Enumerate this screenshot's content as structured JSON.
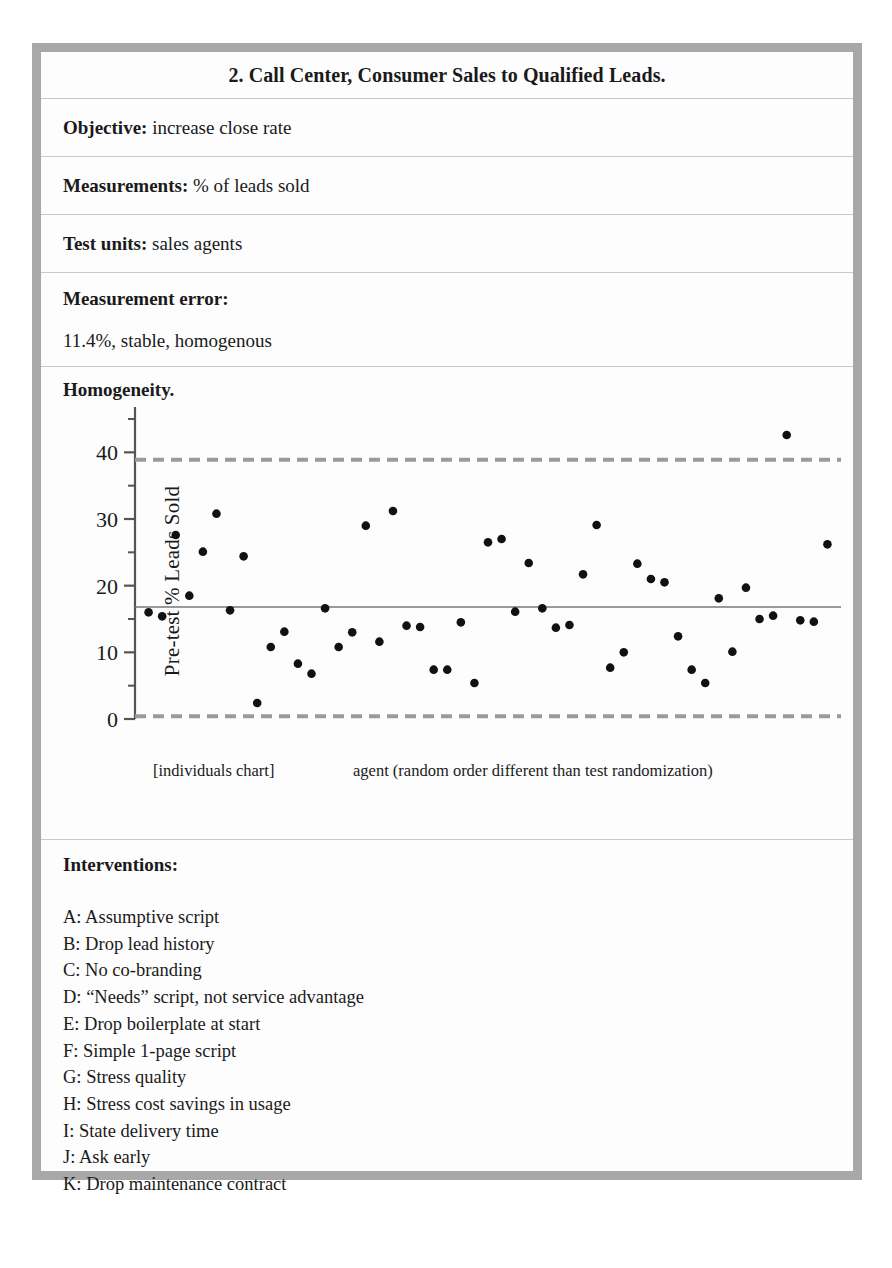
{
  "document": {
    "title": "2. Call Center, Consumer Sales to Qualified Leads."
  },
  "fields": [
    {
      "label": "Objective:",
      "value": " increase close rate"
    },
    {
      "label": "Measurements:",
      "value": " % of leads sold"
    },
    {
      "label": "Test units:",
      "value": " sales agents"
    }
  ],
  "measurement_error": {
    "label": "Measurement error:",
    "value": "11.4%, stable, homogenous"
  },
  "homogeneity": {
    "heading": "Homogeneity.",
    "caption_left": "[individuals chart]",
    "caption_right": "agent (random order different than test randomization)"
  },
  "interventions": {
    "title": "Interventions:",
    "items": [
      "A: Assumptive script",
      "B: Drop lead history",
      "C: No co-branding",
      "D: “Needs” script, not service advantage",
      "E: Drop boilerplate at start",
      "F: Simple 1-page script",
      "G: Stress quality",
      "H: Stress cost savings in usage",
      "I: State delivery time",
      "J: Ask early",
      "K: Drop maintenance contract"
    ]
  },
  "colors": {
    "frame": "#a8a8a8",
    "divider": "#c9c9c9",
    "point": "#111111",
    "center_line": "#777777",
    "control_limit": "#9a9a9a",
    "axis": "#555555"
  },
  "chart_data": {
    "type": "scatter",
    "title": "",
    "xlabel": "agent (random order different than test randomization)",
    "ylabel": "Pre-test % Leads Sold",
    "ylim": [
      0,
      45
    ],
    "yticks": [
      0,
      10,
      20,
      30,
      40
    ],
    "ytick_labels": [
      "0",
      "10",
      "20",
      "30",
      "40"
    ],
    "minor_yticks": [
      5,
      15,
      25,
      35,
      45
    ],
    "xlim": [
      0,
      52
    ],
    "grid": false,
    "legend": null,
    "annotations": [
      {
        "name": "upper-control-limit",
        "y": 38.9,
        "style": "dashed",
        "color": "#9a9a9a"
      },
      {
        "name": "center-line",
        "y": 16.8,
        "style": "solid",
        "color": "#777777"
      },
      {
        "name": "lower-control-limit",
        "y": 0.4,
        "style": "dashed",
        "color": "#9a9a9a"
      }
    ],
    "series": [
      {
        "name": "Pre-test % Leads Sold",
        "marker": "filled-circle",
        "color": "#111111",
        "x": [
          1,
          2,
          3,
          4,
          5,
          6,
          7,
          8,
          9,
          10,
          11,
          12,
          13,
          14,
          15,
          16,
          17,
          18,
          19,
          20,
          21,
          22,
          23,
          24,
          25,
          26,
          27,
          28,
          29,
          30,
          31,
          32,
          33,
          34,
          35,
          36,
          37,
          38,
          39,
          40,
          41,
          42,
          43,
          44,
          45,
          46,
          47,
          48,
          49,
          50,
          51
        ],
        "values": [
          16.0,
          15.4,
          27.6,
          18.5,
          25.1,
          30.8,
          16.3,
          24.4,
          2.4,
          10.8,
          13.1,
          8.3,
          6.8,
          16.6,
          10.8,
          13.0,
          29.0,
          11.6,
          31.2,
          14.0,
          13.8,
          7.4,
          7.4,
          14.5,
          5.4,
          26.5,
          27.0,
          16.1,
          23.4,
          16.6,
          13.7,
          14.1,
          21.7,
          29.1,
          7.7,
          10.0,
          23.3,
          21.0,
          20.5,
          12.4,
          7.4,
          5.4,
          18.1,
          10.1,
          19.7,
          15.0,
          15.5,
          42.6,
          14.8,
          14.6,
          26.2
        ]
      }
    ]
  }
}
